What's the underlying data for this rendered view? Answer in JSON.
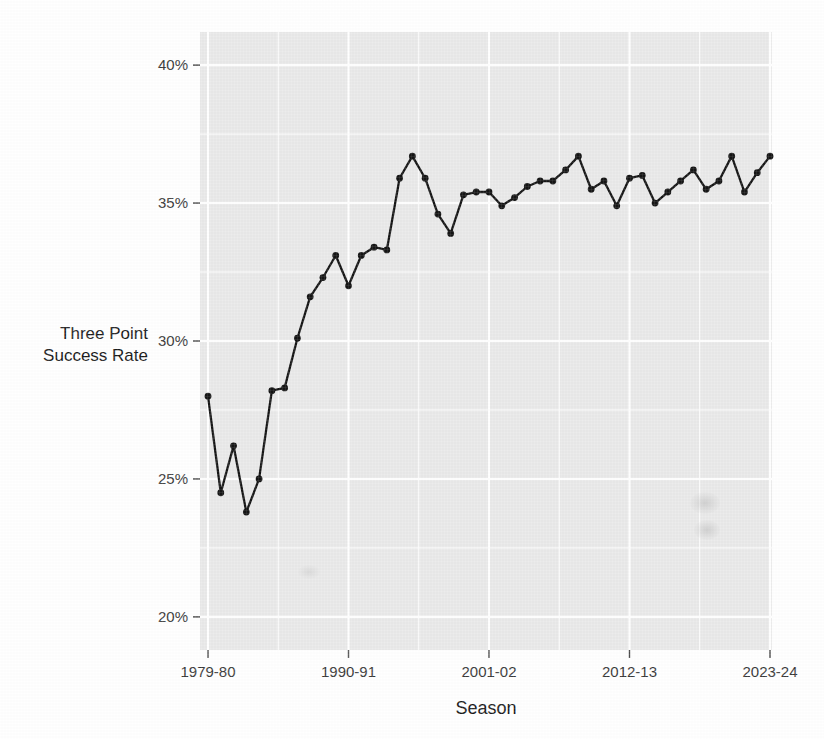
{
  "chart_data": {
    "type": "line",
    "title": "",
    "xlabel": "Season",
    "ylabel": "Three Point Success Rate",
    "ylabel_line1": "Three Point",
    "ylabel_line2": "Success Rate",
    "xlim": [
      "1979-80",
      "2023-24"
    ],
    "ylim": [
      18.8,
      41.2
    ],
    "y_major_ticks": [
      20,
      25,
      30,
      35,
      40
    ],
    "y_major_tick_labels": [
      "20%",
      "25%",
      "30%",
      "35%",
      "40%"
    ],
    "y_minor_ticks": [
      22.5,
      27.5,
      32.5,
      37.5
    ],
    "x_tick_labels": [
      "1979-80",
      "1990-91",
      "2001-02",
      "2012-13",
      "2023-24"
    ],
    "x_tick_seasons": [
      "1979-80",
      "1990-91",
      "2001-02",
      "2012-13",
      "2023-24"
    ],
    "grid": true,
    "legend": "none",
    "point_marker": "filled-circle",
    "line_color": "#151515",
    "panel_color": "#e9e9e9",
    "grid_color": "#ffffff",
    "categories": [
      "1979-80",
      "1980-81",
      "1981-82",
      "1982-83",
      "1983-84",
      "1984-85",
      "1985-86",
      "1986-87",
      "1987-88",
      "1988-89",
      "1989-90",
      "1990-91",
      "1991-92",
      "1992-93",
      "1993-94",
      "1994-95",
      "1995-96",
      "1996-97",
      "1997-98",
      "1998-99",
      "1999-00",
      "2000-01",
      "2001-02",
      "2002-03",
      "2003-04",
      "2004-05",
      "2005-06",
      "2006-07",
      "2007-08",
      "2008-09",
      "2009-10",
      "2010-11",
      "2011-12",
      "2012-13",
      "2013-14",
      "2014-15",
      "2015-16",
      "2016-17",
      "2017-18",
      "2018-19",
      "2019-20",
      "2020-21",
      "2021-22",
      "2022-23",
      "2023-24"
    ],
    "values": [
      28.0,
      24.5,
      26.2,
      23.8,
      25.0,
      28.2,
      28.3,
      30.1,
      31.6,
      32.3,
      33.1,
      32.0,
      33.1,
      33.4,
      33.3,
      35.9,
      36.7,
      35.9,
      34.6,
      33.9,
      35.3,
      35.4,
      35.4,
      34.9,
      35.2,
      35.6,
      35.8,
      35.8,
      36.2,
      36.7,
      35.5,
      35.8,
      34.9,
      35.9,
      36.0,
      35.0,
      35.4,
      35.8,
      36.2,
      35.5,
      35.8,
      36.7,
      35.4,
      36.1,
      36.7
    ]
  },
  "axis": {
    "y_label_line1": "Three Point",
    "y_label_line2": "Success Rate",
    "x_label": "Season",
    "y_ticks": [
      "40%",
      "35%",
      "30%",
      "25%",
      "20%"
    ],
    "x_ticks": [
      "1979-80",
      "1990-91",
      "2001-02",
      "2012-13",
      "2023-24"
    ]
  }
}
